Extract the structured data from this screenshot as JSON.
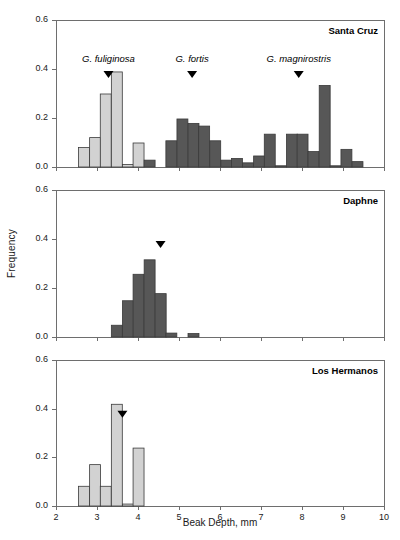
{
  "chart_data": {
    "type": "bar",
    "title": "",
    "xlabel": "Beak Depth, mm",
    "ylabel": "Frequency",
    "xlim": [
      2,
      10
    ],
    "ylim": [
      0,
      0.6
    ],
    "xticks": [
      2,
      3,
      4,
      5,
      6,
      7,
      8,
      9,
      10
    ],
    "yticks": [
      0.0,
      0.2,
      0.4,
      0.6
    ],
    "ytick_labels": [
      "0.0",
      "0.2",
      "0.4",
      "0.6"
    ],
    "xtick_labels": [
      "2",
      "3",
      "4",
      "5",
      "6",
      "7",
      "8",
      "9",
      "10"
    ],
    "grid": false,
    "legend": "none",
    "bin_width": 0.267,
    "colors": {
      "light_bar": "#d2d2d2",
      "dark_bar": "#575757",
      "bar_border": "#3a3a3a",
      "axis": "#6e6e6e",
      "text": "#1a1a1a"
    },
    "species_markers": [
      {
        "label": "G. fuliginosa",
        "x": 3.28
      },
      {
        "label": "G. fortis",
        "x": 5.32
      },
      {
        "label": "G. magnirostris",
        "x": 7.92
      }
    ],
    "panels": [
      {
        "name": "Santa Cruz",
        "marker_panel": true,
        "bins": [
          {
            "x": 2.55,
            "value": 0.08,
            "shade": "light"
          },
          {
            "x": 2.82,
            "value": 0.12,
            "shade": "light"
          },
          {
            "x": 3.08,
            "value": 0.298,
            "shade": "light"
          },
          {
            "x": 3.35,
            "value": 0.388,
            "shade": "light"
          },
          {
            "x": 3.62,
            "value": 0.01,
            "shade": "light"
          },
          {
            "x": 3.88,
            "value": 0.098,
            "shade": "light"
          },
          {
            "x": 4.15,
            "value": 0.028,
            "shade": "dark"
          },
          {
            "x": 4.42,
            "value": 0.0,
            "shade": "dark"
          },
          {
            "x": 4.68,
            "value": 0.107,
            "shade": "dark"
          },
          {
            "x": 4.95,
            "value": 0.196,
            "shade": "dark"
          },
          {
            "x": 5.22,
            "value": 0.178,
            "shade": "dark"
          },
          {
            "x": 5.48,
            "value": 0.167,
            "shade": "dark"
          },
          {
            "x": 5.75,
            "value": 0.107,
            "shade": "dark"
          },
          {
            "x": 6.02,
            "value": 0.028,
            "shade": "dark"
          },
          {
            "x": 6.28,
            "value": 0.035,
            "shade": "dark"
          },
          {
            "x": 6.55,
            "value": 0.017,
            "shade": "dark"
          },
          {
            "x": 6.82,
            "value": 0.045,
            "shade": "dark"
          },
          {
            "x": 7.08,
            "value": 0.134,
            "shade": "dark"
          },
          {
            "x": 7.35,
            "value": 0.005,
            "shade": "dark"
          },
          {
            "x": 7.62,
            "value": 0.134,
            "shade": "dark"
          },
          {
            "x": 7.88,
            "value": 0.134,
            "shade": "dark"
          },
          {
            "x": 8.15,
            "value": 0.063,
            "shade": "dark"
          },
          {
            "x": 8.42,
            "value": 0.333,
            "shade": "dark"
          },
          {
            "x": 8.68,
            "value": 0.005,
            "shade": "dark"
          },
          {
            "x": 8.95,
            "value": 0.072,
            "shade": "dark"
          },
          {
            "x": 9.22,
            "value": 0.022,
            "shade": "dark"
          }
        ]
      },
      {
        "name": "Daphne",
        "marker_panel": false,
        "marker_x": 4.55,
        "bins": [
          {
            "x": 3.35,
            "value": 0.048,
            "shade": "dark"
          },
          {
            "x": 3.62,
            "value": 0.148,
            "shade": "dark"
          },
          {
            "x": 3.88,
            "value": 0.256,
            "shade": "dark"
          },
          {
            "x": 4.15,
            "value": 0.315,
            "shade": "dark"
          },
          {
            "x": 4.42,
            "value": 0.177,
            "shade": "dark"
          },
          {
            "x": 4.68,
            "value": 0.016,
            "shade": "dark"
          },
          {
            "x": 4.95,
            "value": 0.0,
            "shade": "dark"
          },
          {
            "x": 5.22,
            "value": 0.014,
            "shade": "dark"
          }
        ]
      },
      {
        "name": "Los Hermanos",
        "marker_panel": false,
        "marker_x": 3.62,
        "bins": [
          {
            "x": 2.55,
            "value": 0.081,
            "shade": "light"
          },
          {
            "x": 2.82,
            "value": 0.17,
            "shade": "light"
          },
          {
            "x": 3.08,
            "value": 0.081,
            "shade": "light"
          },
          {
            "x": 3.35,
            "value": 0.418,
            "shade": "light"
          },
          {
            "x": 3.62,
            "value": 0.008,
            "shade": "light"
          },
          {
            "x": 3.88,
            "value": 0.238,
            "shade": "light"
          }
        ]
      }
    ]
  }
}
